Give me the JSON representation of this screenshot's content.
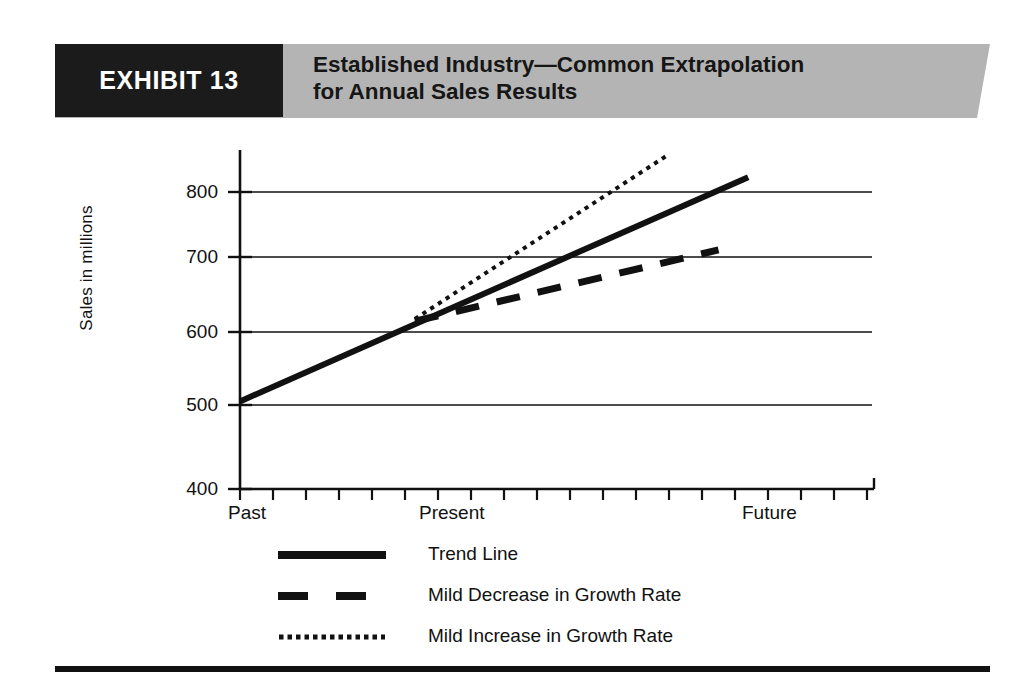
{
  "exhibit": {
    "badge_label": "EXHIBIT 13",
    "title_line_1": "Established Industry—Common Extrapolation",
    "title_line_2": "for Annual Sales Results",
    "badge_bg": "#1b1b1b",
    "badge_fg": "#ffffff",
    "banner_bg": "#b4b4b4"
  },
  "chart_data": {
    "type": "line",
    "title": "Established Industry—Common Extrapolation for Annual Sales Results",
    "xlabel": "",
    "ylabel": "Sales in millions",
    "ylim": [
      400,
      850
    ],
    "yticks": [
      400,
      500,
      600,
      700,
      800
    ],
    "ytick_labels": [
      "400",
      "500",
      "600",
      "700",
      "800"
    ],
    "xtick_labels": [
      "Past",
      "Present",
      "Future"
    ],
    "xtick_positions": [
      0,
      6,
      16
    ],
    "x_minor_tick_count": 19,
    "grid": "horizontal",
    "legend_position": "below",
    "branch_point": {
      "x_label": "Present",
      "x": 5.3,
      "y": 628
    },
    "series": [
      {
        "name": "Trend Line",
        "style": "solid",
        "color": "#111111",
        "width_px": 6,
        "points": [
          {
            "x": 0.0,
            "y": 518
          },
          {
            "x": 15.4,
            "y": 820
          }
        ]
      },
      {
        "name": "Mild Decrease in Growth Rate",
        "style": "dashed",
        "color": "#111111",
        "width_px": 7,
        "points": [
          {
            "x": 5.3,
            "y": 626
          },
          {
            "x": 14.5,
            "y": 722
          }
        ]
      },
      {
        "name": "Mild Increase in Growth Rate",
        "style": "dotted",
        "color": "#111111",
        "width_px": 4,
        "points": [
          {
            "x": 5.3,
            "y": 629
          },
          {
            "x": 12.9,
            "y": 848
          }
        ]
      }
    ]
  },
  "legend": {
    "items": [
      {
        "label": "Trend Line",
        "style": "solid"
      },
      {
        "label": "Mild Decrease in Growth Rate",
        "style": "dashed"
      },
      {
        "label": "Mild Increase in Growth Rate",
        "style": "dotted"
      }
    ]
  }
}
